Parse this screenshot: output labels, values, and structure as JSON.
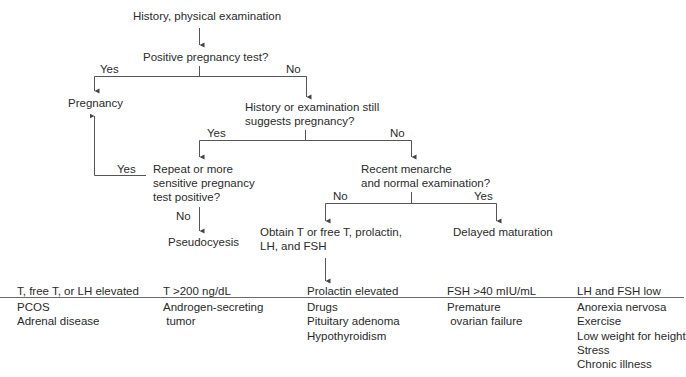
{
  "flowchart": {
    "start": "History, physical examination",
    "q1": "Positive pregnancy test?",
    "q1_yes": "Yes",
    "q1_no": "No",
    "pregnancy": "Pregnancy",
    "q2_line1": "History or examination still",
    "q2_line2": "suggests pregnancy?",
    "q2_yes": "Yes",
    "q2_no": "No",
    "q3_line1": "Repeat or more",
    "q3_line2": "sensitive pregnancy",
    "q3_line3": "test positive?",
    "q3_yes": "Yes",
    "q3_no": "No",
    "pseudocyesis": "Pseudocyesis",
    "q4_line1": "Recent menarche",
    "q4_line2": "and normal examination?",
    "q4_no": "No",
    "q4_yes": "Yes",
    "delayed": "Delayed maturation",
    "obtain_line1": "Obtain T or free T, prolactin,",
    "obtain_line2": "LH, and FSH"
  },
  "results": [
    {
      "header": "T, free T, or LH elevated",
      "items": [
        "PCOS",
        "Adrenal disease"
      ]
    },
    {
      "header": "T >200 ng/dL",
      "items": [
        "Androgen-secreting",
        " tumor"
      ]
    },
    {
      "header": "Prolactin elevated",
      "items": [
        "Drugs",
        "Pituitary adenoma",
        "Hypothyroidism"
      ]
    },
    {
      "header": "FSH >40 mIU/mL",
      "items": [
        "Premature",
        " ovarian failure"
      ]
    },
    {
      "header": "LH and FSH low",
      "items": [
        "Anorexia nervosa",
        "Exercise",
        "Low weight for height",
        "Stress",
        "Chronic illness"
      ]
    }
  ],
  "colors": {
    "line": "#555555",
    "text": "#2b2b2b",
    "background": "#ffffff"
  }
}
